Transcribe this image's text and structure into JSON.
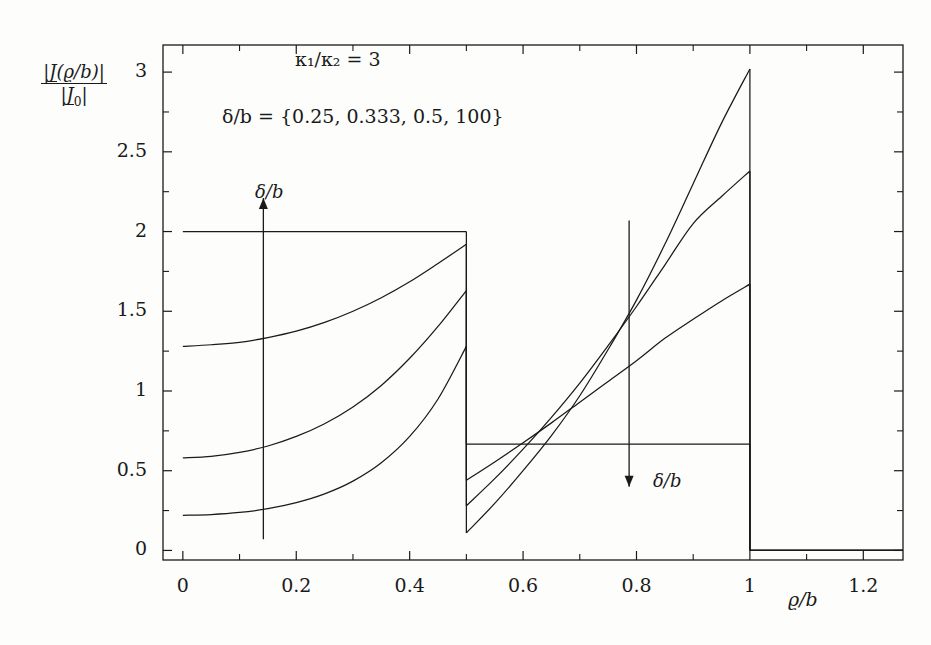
{
  "figure": {
    "background": "#fdfdfc",
    "ink": "#1a1a1a"
  },
  "axis": {
    "y_label_numerator_abs_open": "|",
    "y_label_numerator_J": "J",
    "y_label_numerator_arg": "(ϱ/b)",
    "y_label_numerator_abs_close": "|",
    "y_label_denominator_abs_open": "|",
    "y_label_denominator_J": "J",
    "y_label_denominator_sub": "0",
    "y_label_denominator_abs_close": "|",
    "x_label": "ϱ/b"
  },
  "annotations": {
    "kappa_ratio": "κ₁/κ₂ = 3",
    "delta_set": "δ/b = {0.25, 0.333, 0.5, 100}",
    "arrow_up_label": "δ/b",
    "arrow_down_label": "δ/b"
  },
  "chart_data": {
    "type": "line",
    "title": "",
    "xlabel": "ϱ/b",
    "ylabel": "|J(ϱ/b)| / |J₀|",
    "xlim": [
      -0.035,
      1.27
    ],
    "ylim": [
      -0.06,
      3.17
    ],
    "xticks": [
      0,
      0.2,
      0.4,
      0.6,
      0.8,
      1,
      1.2
    ],
    "xticklabels": [
      "0",
      "0.2",
      "0.4",
      "0.6",
      "0.8",
      "1",
      "1.2"
    ],
    "yticks": [
      0,
      0.5,
      1,
      1.5,
      2,
      2.5,
      3
    ],
    "yticklabels": [
      "0",
      "0.5",
      "1",
      "1.5",
      "2",
      "2.5",
      "3"
    ],
    "grid": false,
    "legend": "none",
    "parameters": {
      "kappa1_over_kappa2": 3,
      "delta_over_b_values": [
        0.25,
        0.333,
        0.5,
        100
      ]
    },
    "discontinuities": [
      {
        "x": 0.5,
        "note": "interface between inner and outer conductor region"
      },
      {
        "x": 1.0,
        "note": "outer surface; current density drops to 0"
      }
    ],
    "annotations": [
      {
        "text": "κ₁/κ₂ = 3",
        "x": 0.37,
        "y": 2.84
      },
      {
        "text": "δ/b = {0.25, 0.333, 0.5, 100}",
        "x": 0.37,
        "y": 2.48
      },
      {
        "text": "δ/b",
        "x": 0.165,
        "y": 2.3,
        "arrow": "up",
        "arrow_x": 0.142,
        "arrow_y0": 0.07,
        "arrow_y1": 2.21
      },
      {
        "text": "δ/b",
        "x": 0.82,
        "y": 0.33,
        "arrow": "down",
        "arrow_x": 0.787,
        "arrow_y0": 2.07,
        "arrow_y1": 0.4
      }
    ],
    "series": [
      {
        "name": "δ/b = 0.25",
        "delta_over_b": 0.25,
        "inner_x": [
          0,
          0.05,
          0.1,
          0.15,
          0.2,
          0.25,
          0.3,
          0.35,
          0.4,
          0.45,
          0.5
        ],
        "inner_y": [
          0.22,
          0.225,
          0.238,
          0.262,
          0.3,
          0.355,
          0.435,
          0.55,
          0.715,
          0.95,
          1.28
        ],
        "outer_x": [
          0.5,
          0.55,
          0.6,
          0.65,
          0.7,
          0.75,
          0.8,
          0.85,
          0.9,
          0.95,
          1.0
        ],
        "outer_y": [
          0.11,
          0.295,
          0.5,
          0.72,
          0.97,
          1.26,
          1.57,
          1.92,
          2.3,
          2.68,
          3.02
        ],
        "beyond_x": [
          1.0,
          1.27
        ],
        "beyond_y": [
          0.0,
          0.0
        ]
      },
      {
        "name": "δ/b = 0.333",
        "delta_over_b": 0.333,
        "inner_x": [
          0,
          0.05,
          0.1,
          0.15,
          0.2,
          0.25,
          0.3,
          0.35,
          0.4,
          0.45,
          0.5
        ],
        "inner_y": [
          0.58,
          0.59,
          0.615,
          0.655,
          0.715,
          0.795,
          0.9,
          1.035,
          1.205,
          1.405,
          1.63
        ],
        "outer_x": [
          0.5,
          0.55,
          0.6,
          0.65,
          0.7,
          0.75,
          0.8,
          0.85,
          0.9,
          0.95,
          1.0
        ],
        "outer_y": [
          0.28,
          0.45,
          0.635,
          0.835,
          1.05,
          1.285,
          1.53,
          1.79,
          2.05,
          2.22,
          2.38
        ],
        "beyond_x": [
          1.0,
          1.27
        ],
        "beyond_y": [
          0.0,
          0.0
        ]
      },
      {
        "name": "δ/b = 0.5",
        "delta_over_b": 0.5,
        "inner_x": [
          0,
          0.05,
          0.1,
          0.15,
          0.2,
          0.25,
          0.3,
          0.35,
          0.4,
          0.45,
          0.5
        ],
        "inner_y": [
          1.28,
          1.29,
          1.305,
          1.335,
          1.375,
          1.43,
          1.5,
          1.585,
          1.685,
          1.8,
          1.92
        ],
        "outer_x": [
          0.5,
          0.55,
          0.6,
          0.65,
          0.7,
          0.75,
          0.8,
          0.85,
          0.9,
          0.95,
          1.0
        ],
        "outer_y": [
          0.44,
          0.555,
          0.675,
          0.8,
          0.93,
          1.06,
          1.19,
          1.33,
          1.45,
          1.565,
          1.67
        ],
        "beyond_x": [
          1.0,
          1.27
        ],
        "beyond_y": [
          0.0,
          0.0
        ]
      },
      {
        "name": "δ/b = 100",
        "delta_over_b": 100,
        "inner_x": [
          0,
          0.5
        ],
        "inner_y": [
          2.0,
          2.0
        ],
        "outer_x": [
          0.5,
          1.0
        ],
        "outer_y": [
          0.667,
          0.667
        ],
        "beyond_x": [
          1.0,
          1.27
        ],
        "beyond_y": [
          0.0,
          0.0
        ]
      }
    ]
  }
}
